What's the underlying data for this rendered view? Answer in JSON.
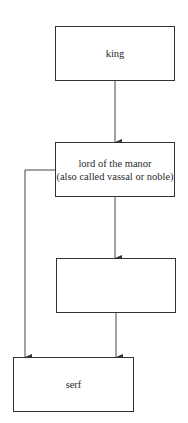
{
  "diagram": {
    "type": "hierarchy",
    "nodes": [
      {
        "id": "king",
        "lines": [
          "king"
        ]
      },
      {
        "id": "lord",
        "lines": [
          "lord of the manor",
          "(also called vassal or noble)"
        ]
      },
      {
        "id": "blank",
        "lines": []
      },
      {
        "id": "serf",
        "lines": [
          "serf"
        ]
      }
    ],
    "edges": [
      {
        "from": "king",
        "to": "lord"
      },
      {
        "from": "lord",
        "to": "blank"
      },
      {
        "from": "lord",
        "to": "serf"
      },
      {
        "from": "blank",
        "to": "serf"
      }
    ],
    "colors": {
      "stroke": "#333333",
      "background": "#ffffff",
      "text": "#2a2a2a"
    }
  }
}
